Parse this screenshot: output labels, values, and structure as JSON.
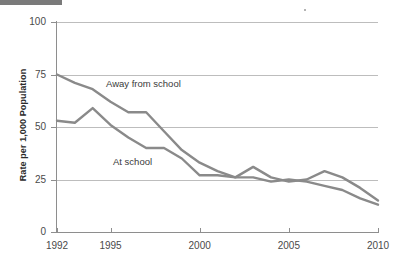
{
  "figure": {
    "top_rule": "decorative-rule",
    "speck": "print-artifact-dot"
  },
  "axes": {
    "y_title": "Rate per 1,000 Population",
    "y_ticks": [
      "0",
      "25",
      "50",
      "75",
      "100"
    ],
    "y_tick_values": [
      0,
      25,
      50,
      75,
      100
    ],
    "x_ticks": [
      "1992",
      "1995",
      "2000",
      "2005",
      "2010"
    ],
    "x_tick_values": [
      1992,
      1995,
      2000,
      2005,
      2010
    ]
  },
  "labels": {
    "away": "Away from school",
    "at": "At school"
  },
  "colors": {
    "line": "#8a8a8a",
    "gridline": "#bdbdbd",
    "axis": "#8e8e8e",
    "text": "#4a4a4a",
    "title_text": "#2b2b2b",
    "rule": "#7a7a7a"
  },
  "chart_data": {
    "type": "line",
    "title": "",
    "xlabel": "",
    "ylabel": "Rate per 1,000 Population",
    "xlim": [
      1992,
      2010
    ],
    "ylim": [
      0,
      100
    ],
    "yticks": [
      0,
      25,
      50,
      75,
      100
    ],
    "xticks": [
      1992,
      1995,
      2000,
      2005,
      2010
    ],
    "grid": "horizontal",
    "legend": "inline-annotations",
    "x": [
      1992,
      1993,
      1994,
      1995,
      1996,
      1997,
      1998,
      1999,
      2000,
      2001,
      2002,
      2003,
      2004,
      2005,
      2006,
      2007,
      2008,
      2009,
      2010
    ],
    "series": [
      {
        "name": "Away from school",
        "values": [
          75,
          71,
          68,
          62,
          57,
          57,
          48,
          39,
          33,
          29,
          26,
          31,
          26,
          24,
          25,
          29,
          26,
          21,
          15
        ]
      },
      {
        "name": "At school",
        "values": [
          53,
          52,
          59,
          51,
          45,
          40,
          40,
          35,
          27,
          27,
          26,
          26,
          24,
          25,
          24,
          22,
          20,
          16,
          13
        ]
      }
    ]
  }
}
